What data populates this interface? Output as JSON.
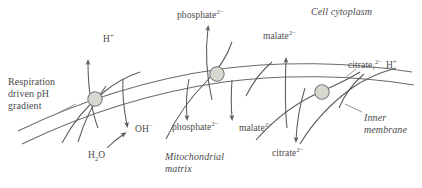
{
  "diagram": {
    "colors": {
      "line": "#5a5a5a",
      "membrane": "#6b6b6b",
      "transporter_fill": "#d8d8d0",
      "transporter_stroke": "#7a7a7a",
      "text": "#4a4a4a",
      "background": "#ffffff"
    },
    "regions": {
      "cytoplasm": "Cell cytoplasm",
      "matrix_line1": "Mitochondrial",
      "matrix_line2": "matrix",
      "membrane_line1": "Inner",
      "membrane_line2": "membrane"
    },
    "gradient_label": {
      "line1": "Respiration",
      "line2": "driven pH",
      "line3": "gradient"
    },
    "species": {
      "proton_top": "H",
      "proton_top_charge": "+",
      "water": "H",
      "water_sub": "2",
      "water_tail": "O",
      "hydroxide": "OH",
      "hydroxide_charge": "−",
      "phosphate_out": "phosphate",
      "phosphate_out_charge": "2−",
      "phosphate_in": "phosphate",
      "phosphate_in_charge": "2−",
      "malate_out": "malate",
      "malate_out_charge": "2−",
      "malate_in": "malate",
      "malate_in_charge": "2−",
      "malate_left_out": "malate",
      "malate_left_out_charge": "2−",
      "citrate_out": "citrate,",
      "citrate_out_charge": "2−",
      "citrate_out_proton": "H",
      "citrate_out_proton_charge": "+",
      "citrate_in": "citrate",
      "citrate_in_charge": "2−"
    },
    "transporters": [
      {
        "name": "proton-pump-transporter",
        "cx": 95,
        "cy": 99
      },
      {
        "name": "phosphate-transporter",
        "cx": 217,
        "cy": 74
      },
      {
        "name": "citrate-malate-transporter",
        "cx": 322,
        "cy": 92
      }
    ]
  }
}
